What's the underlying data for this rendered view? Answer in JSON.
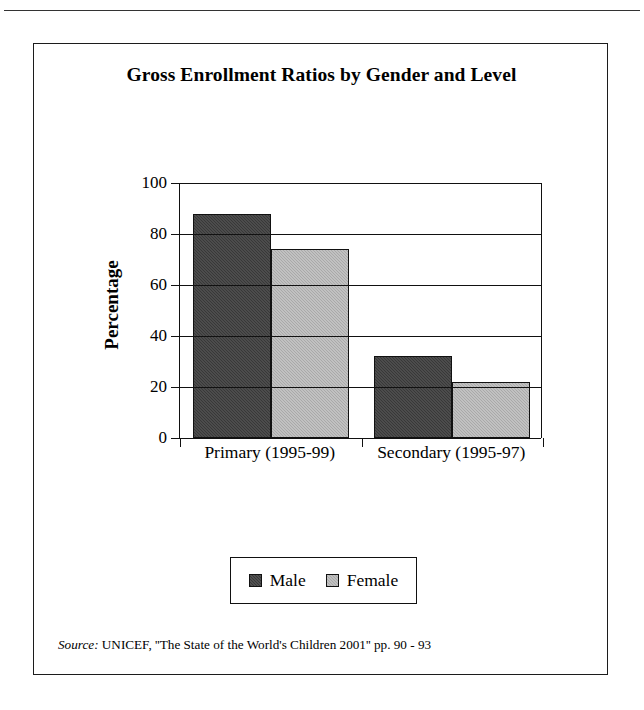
{
  "figure": {
    "title": "Gross Enrollment Ratios by Gender and Level",
    "source_label": "Source:",
    "source_text": "UNICEF, ''The State of the World's Children 2001'' pp. 90 - 93"
  },
  "chart_data": {
    "type": "bar",
    "title": "Gross Enrollment Ratios by Gender and Level",
    "categories": [
      "Primary (1995-99)",
      "Secondary (1995-97)"
    ],
    "series": [
      {
        "name": "Male",
        "values": [
          88,
          32
        ],
        "color": "#383838"
      },
      {
        "name": "Female",
        "values": [
          74,
          22
        ],
        "color": "#a9a9a9"
      }
    ],
    "xlabel": "",
    "ylabel": "Percentage",
    "ylim": [
      0,
      100
    ],
    "yticks": [
      0,
      20,
      40,
      60,
      80,
      100
    ],
    "ytick_labels": [
      "0",
      "20",
      "40",
      "60",
      "80",
      "100"
    ],
    "grid": true,
    "grid_axis": "y",
    "legend_position": "bottom"
  },
  "legend": {
    "items": [
      {
        "label": "Male"
      },
      {
        "label": "Female"
      }
    ]
  }
}
